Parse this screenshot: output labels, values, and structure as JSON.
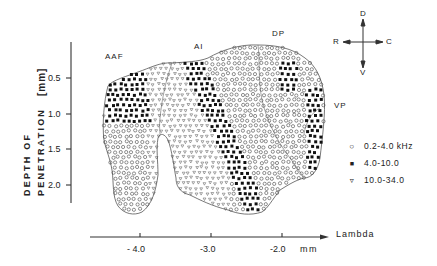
{
  "figure": {
    "y_axis": {
      "title_line1": "DEPTH   OF",
      "title_line2": "PENETRATION",
      "unit": "[mm]",
      "ticks": [
        "0.5",
        "1.0",
        "1.5",
        "2.0"
      ]
    },
    "x_axis": {
      "label": "Lambda",
      "unit": "mm",
      "ticks": [
        "- 4.0",
        "-3.0",
        "-2.0"
      ]
    },
    "regions": [
      "AAF",
      "AI",
      "DP",
      "VP"
    ],
    "orientation": {
      "up": "D",
      "down": "V",
      "left": "R",
      "right": "C"
    },
    "legend": [
      {
        "symbol": "open-circle",
        "glyph": "○",
        "label": "0.2-4.0  kHz"
      },
      {
        "symbol": "filled-square",
        "glyph": "■",
        "label": "4.0-10.0"
      },
      {
        "symbol": "open-triangle",
        "glyph": "▿",
        "label": "10.0-34.0"
      }
    ]
  },
  "chart_data": {
    "type": "scatter",
    "title": "",
    "xlabel": "Lambda (mm)",
    "ylabel": "DEPTH OF PENETRATION [mm]",
    "x_ticks": [
      -4.0,
      -3.0,
      -2.0
    ],
    "y_ticks": [
      0.5,
      1.0,
      1.5,
      2.0
    ],
    "ylim": [
      2.3,
      0.1
    ],
    "xlim": [
      -4.7,
      -1.0
    ],
    "legend_position": "right",
    "grid": false,
    "series": [
      {
        "name": "0.2-4.0 kHz",
        "marker": "open-circle",
        "regions_described": [
          "AAF ventral lobe (x -4.3 to -3.8, depth 1.3-2.1)",
          "AI caudal half / DP (x -3.0 to -1.7, depth 0.3-2.2)",
          "VP caudal margin"
        ]
      },
      {
        "name": "4.0-10.0 kHz",
        "marker": "filled-square",
        "regions_described": [
          "AAF dorsal (x -4.5 to -3.6, depth 0.6-1.4)",
          "AI diagonal band (x -3.4 to -2.5, depth 0.4-2.2)",
          "DP cluster (x -2.0 to -1.7, depth 0.4-0.8)",
          "VP band (x -1.7 to -1.6, depth 0.7-1.6)"
        ]
      },
      {
        "name": "10.0-34.0 kHz",
        "marker": "open-triangle",
        "regions_described": [
          "AAF/AI border (x -3.7 to -3.3, depth 0.5-2.1)",
          "AI rostral wedge"
        ]
      }
    ],
    "region_labels": [
      {
        "text": "AAF",
        "x": -4.2,
        "y": 0.3
      },
      {
        "text": "AI",
        "x": -3.2,
        "y": 0.25
      },
      {
        "text": "DP",
        "x": -2.0,
        "y": 0.15
      },
      {
        "text": "VP",
        "x": -1.45,
        "y": 1.1
      }
    ]
  }
}
